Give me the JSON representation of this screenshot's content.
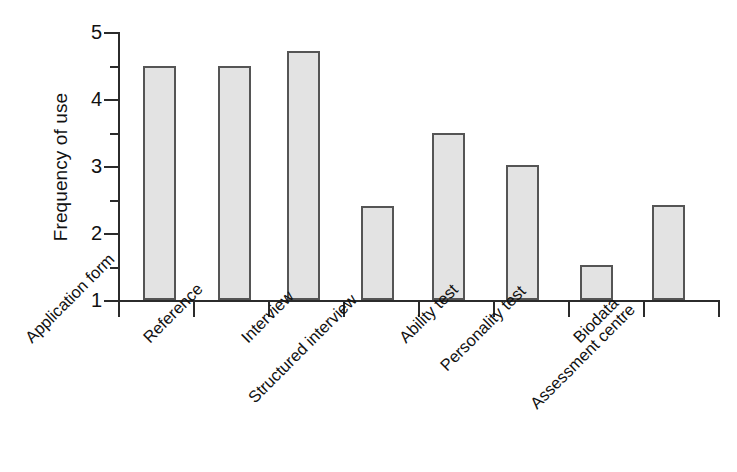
{
  "chart_data": {
    "type": "bar",
    "title": "",
    "subtitle": "",
    "xlabel": "",
    "ylabel": "Frequency of use",
    "categories": [
      "Application form",
      "Reference",
      "Interview",
      "Structured interview",
      "Ability test",
      "Personality test",
      "Biodata",
      "Assessment centre"
    ],
    "values": [
      4.5,
      4.5,
      4.72,
      2.4,
      3.5,
      3.02,
      1.52,
      2.42
    ],
    "ylim": [
      1,
      5
    ],
    "y_ticks": [
      1,
      2,
      3,
      4,
      5
    ],
    "y_tick_labels": [
      "1",
      "2",
      "3",
      "4",
      "5"
    ],
    "minor_ticks": true,
    "grid": false,
    "legend": false,
    "legend_position": "none",
    "bar_fill_color": "#e3e3e3",
    "bar_edge_color": "#555555",
    "axis_color": "#2b2b2b"
  }
}
